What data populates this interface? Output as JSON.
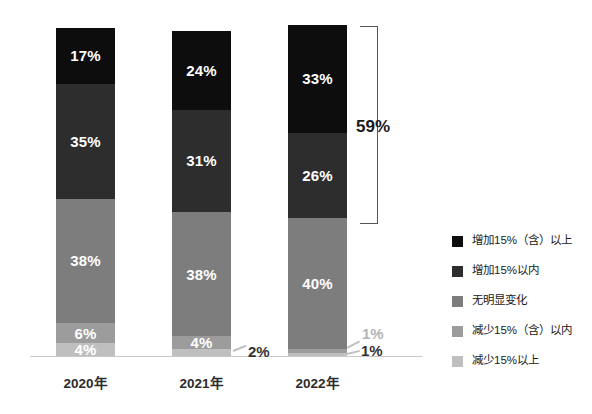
{
  "chart_data": {
    "type": "bar",
    "subtype": "stacked-100-percent",
    "title": "",
    "subtitle": "",
    "xlabel": "",
    "ylabel": "",
    "ylim": [
      0,
      100
    ],
    "grid": false,
    "legend_position": "right",
    "categories": [
      "2020年",
      "2021年",
      "2022年"
    ],
    "series": [
      {
        "name": "增加15%（含）以上",
        "color": "#0d0d0d",
        "values": [
          17,
          24,
          33
        ]
      },
      {
        "name": "增加15%以内",
        "color": "#2d2d2d",
        "values": [
          35,
          31,
          26
        ]
      },
      {
        "name": "无明显变化",
        "color": "#7d7d7d",
        "values": [
          38,
          38,
          40
        ]
      },
      {
        "name": "减少15%（含）以内",
        "color": "#9c9c9c",
        "values": [
          6,
          4,
          1
        ]
      },
      {
        "name": "减少15%以上",
        "color": "#bfbfbf",
        "values": [
          4,
          2,
          1
        ]
      }
    ],
    "data_labels": [
      {
        "category": "2020年",
        "series": "增加15%（含）以上",
        "text": "17%",
        "placement": "inside"
      },
      {
        "category": "2020年",
        "series": "增加15%以内",
        "text": "35%",
        "placement": "inside"
      },
      {
        "category": "2020年",
        "series": "无明显变化",
        "text": "38%",
        "placement": "inside"
      },
      {
        "category": "2020年",
        "series": "减少15%（含）以内",
        "text": "6%",
        "placement": "inside"
      },
      {
        "category": "2020年",
        "series": "减少15%以上",
        "text": "4%",
        "placement": "inside"
      },
      {
        "category": "2021年",
        "series": "增加15%（含）以上",
        "text": "24%",
        "placement": "inside"
      },
      {
        "category": "2021年",
        "series": "增加15%以内",
        "text": "31%",
        "placement": "inside"
      },
      {
        "category": "2021年",
        "series": "无明显变化",
        "text": "38%",
        "placement": "inside"
      },
      {
        "category": "2021年",
        "series": "减少15%（含）以内",
        "text": "4%",
        "placement": "inside"
      },
      {
        "category": "2021年",
        "series": "减少15%以上",
        "text": "2%",
        "placement": "outside-right"
      },
      {
        "category": "2022年",
        "series": "增加15%（含）以上",
        "text": "33%",
        "placement": "inside"
      },
      {
        "category": "2022年",
        "series": "增加15%以内",
        "text": "26%",
        "placement": "inside"
      },
      {
        "category": "2022年",
        "series": "无明显变化",
        "text": "40%",
        "placement": "inside"
      },
      {
        "category": "2022年",
        "series": "减少15%（含）以内",
        "text": "1%",
        "placement": "outside-right"
      },
      {
        "category": "2022年",
        "series": "减少15%以上",
        "text": "1%",
        "placement": "outside-right"
      }
    ],
    "annotations": [
      {
        "type": "bracket",
        "label": "59%",
        "category": "2022年",
        "covers": [
          "增加15%（含）以上",
          "增加15%以内"
        ],
        "value": 59
      }
    ]
  },
  "bars": [
    {
      "category": "2020年",
      "segments": [
        {
          "label": "17%",
          "value": 17,
          "color": "#0d0d0d",
          "label_color": "on-dark",
          "show": true
        },
        {
          "label": "35%",
          "value": 35,
          "color": "#2d2d2d",
          "label_color": "on-dark",
          "show": true
        },
        {
          "label": "38%",
          "value": 38,
          "color": "#7d7d7d",
          "label_color": "on-light",
          "show": true
        },
        {
          "label": "6%",
          "value": 6,
          "color": "#9c9c9c",
          "label_color": "on-light",
          "show": true
        },
        {
          "label": "4%",
          "value": 4,
          "color": "#bfbfbf",
          "label_color": "on-light",
          "show": true
        }
      ]
    },
    {
      "category": "2021年",
      "segments": [
        {
          "label": "24%",
          "value": 24,
          "color": "#0d0d0d",
          "label_color": "on-dark",
          "show": true
        },
        {
          "label": "31%",
          "value": 31,
          "color": "#2d2d2d",
          "label_color": "on-dark",
          "show": true
        },
        {
          "label": "38%",
          "value": 38,
          "color": "#7d7d7d",
          "label_color": "on-light",
          "show": true
        },
        {
          "label": "4%",
          "value": 4,
          "color": "#9c9c9c",
          "label_color": "on-light",
          "show": true
        },
        {
          "label": "2%",
          "value": 2,
          "color": "#bfbfbf",
          "label_color": "on-light",
          "show": false
        }
      ]
    },
    {
      "category": "2022年",
      "segments": [
        {
          "label": "33%",
          "value": 33,
          "color": "#0d0d0d",
          "label_color": "on-dark",
          "show": true
        },
        {
          "label": "26%",
          "value": 26,
          "color": "#2d2d2d",
          "label_color": "on-dark",
          "show": true
        },
        {
          "label": "40%",
          "value": 40,
          "color": "#7d7d7d",
          "label_color": "on-light",
          "show": true
        },
        {
          "label": "1%",
          "value": 1,
          "color": "#9c9c9c",
          "label_color": "on-light",
          "show": false
        },
        {
          "label": "1%",
          "value": 1,
          "color": "#bfbfbf",
          "label_color": "on-light",
          "show": false
        }
      ]
    }
  ],
  "callouts": {
    "bar2_bottom": "2%",
    "bar3_upper": "1%",
    "bar3_lower": "1%"
  },
  "bracket": {
    "label": "59%"
  },
  "legend": {
    "items": [
      {
        "label": "增加15%（含）以上",
        "color": "#0d0d0d"
      },
      {
        "label": "增加15%以内",
        "color": "#2d2d2d"
      },
      {
        "label": "无明显变化",
        "color": "#7d7d7d"
      },
      {
        "label": "减少15%（含）以内",
        "color": "#9c9c9c"
      },
      {
        "label": "减少15%以上",
        "color": "#bfbfbf"
      }
    ]
  },
  "axis": {
    "categories": [
      "2020年",
      "2021年",
      "2022年"
    ]
  }
}
